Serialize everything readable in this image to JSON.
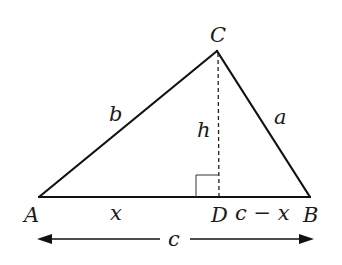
{
  "figure": {
    "type": "triangle-with-altitude",
    "vertices": {
      "A": {
        "label": "A",
        "x": 39,
        "y": 197
      },
      "B": {
        "label": "B",
        "x": 310,
        "y": 197
      },
      "C": {
        "label": "C",
        "x": 217,
        "y": 51
      },
      "D": {
        "label": "D",
        "x": 219,
        "y": 197
      }
    },
    "sides": {
      "a": {
        "label": "a",
        "from": "C",
        "to": "B"
      },
      "b": {
        "label": "b",
        "from": "A",
        "to": "C"
      },
      "c": {
        "label": "c",
        "from": "A",
        "to": "B"
      }
    },
    "altitude": {
      "label": "h",
      "from": "C",
      "to": "D",
      "style": "dashed",
      "right_angle_marker": true
    },
    "segments": {
      "AD": {
        "label": "x"
      },
      "DB": {
        "label": "c − x"
      }
    },
    "dimension": {
      "label": "c",
      "double_arrow": true
    }
  }
}
